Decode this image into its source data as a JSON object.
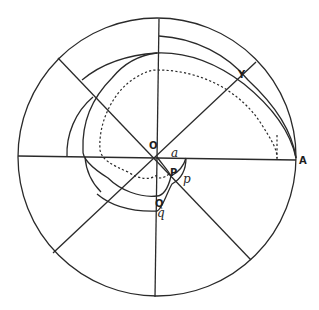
{
  "figure": {
    "labels": {
      "O": "O",
      "a": "a",
      "A": "A",
      "Y": "Y",
      "P": "P",
      "p": "p",
      "Q": "Q",
      "q": "q"
    },
    "colors": {
      "ink": "#2a2a2a",
      "background": "#ffffff"
    }
  }
}
